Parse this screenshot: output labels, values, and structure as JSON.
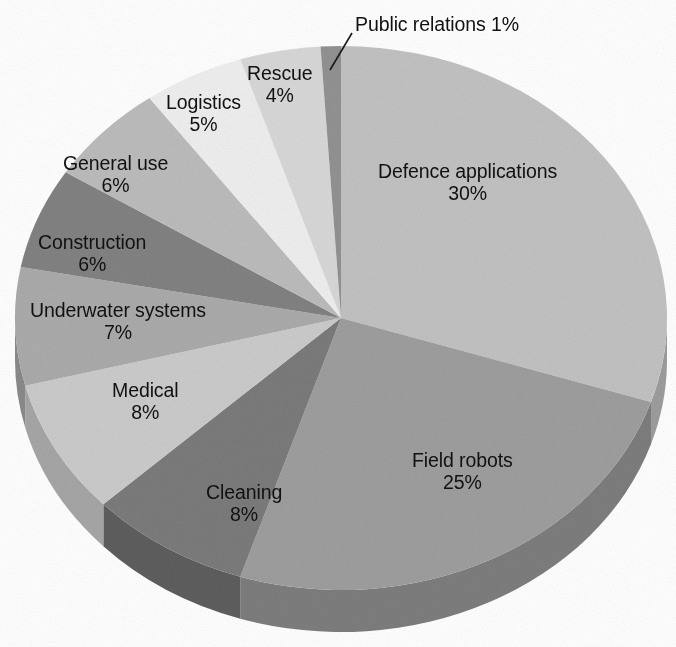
{
  "chart_data": {
    "type": "pie",
    "title": "",
    "subtitle": "",
    "xlabel": "",
    "ylabel": "",
    "legend_position": "none",
    "grid": false,
    "style": "3d-exploded-none",
    "value_unit": "%",
    "categories": [
      "Defence applications",
      "Field robots",
      "Cleaning",
      "Medical",
      "Underwater systems",
      "Construction",
      "General use",
      "Logistics",
      "Rescue",
      "Public relations"
    ],
    "values": [
      30,
      25,
      8,
      8,
      7,
      6,
      6,
      5,
      4,
      1
    ],
    "labels": [
      "Defence applications 30%",
      "Field robots 25%",
      "Cleaning 8%",
      "Medical 8%",
      "Underwater systems 7%",
      "Construction 6%",
      "General use 6%",
      "Logistics 5%",
      "Rescue 4%",
      "Public relations 1%"
    ],
    "slices": [
      {
        "name": "Defence applications",
        "value": 30,
        "value_text": "30%",
        "color": "#c2c2c2",
        "side_color": "#9d9d9d",
        "label_layout": "stacked",
        "label_x": 378,
        "label_y": 160,
        "has_leader": false
      },
      {
        "name": "Field robots",
        "value": 25,
        "value_text": "25%",
        "color": "#9e9e9e",
        "side_color": "#7d7d7d",
        "label_layout": "stacked",
        "label_x": 412,
        "label_y": 449,
        "has_leader": false
      },
      {
        "name": "Cleaning",
        "value": 8,
        "value_text": "8%",
        "color": "#7b7b7b",
        "side_color": "#5e5e5e",
        "label_layout": "stacked",
        "label_x": 206,
        "label_y": 481,
        "has_leader": false
      },
      {
        "name": "Medical",
        "value": 8,
        "value_text": "8%",
        "color": "#cbcbcb",
        "side_color": "#a6a6a6",
        "label_layout": "stacked",
        "label_x": 112,
        "label_y": 379,
        "has_leader": false
      },
      {
        "name": "Underwater systems",
        "value": 7,
        "value_text": "7%",
        "color": "#ababab",
        "side_color": "#8a8a8a",
        "label_layout": "stacked",
        "label_x": 30,
        "label_y": 299,
        "has_leader": false
      },
      {
        "name": "Construction",
        "value": 6,
        "value_text": "6%",
        "color": "#828282",
        "side_color": "#656565",
        "label_layout": "stacked",
        "label_x": 38,
        "label_y": 231,
        "has_leader": false
      },
      {
        "name": "General use",
        "value": 6,
        "value_text": "6%",
        "color": "#bcbcbc",
        "side_color": "#979797",
        "label_layout": "stacked",
        "label_x": 63,
        "label_y": 152,
        "has_leader": false
      },
      {
        "name": "Logistics",
        "value": 5,
        "value_text": "5%",
        "color": "#efefef",
        "side_color": "#c4c4c4",
        "label_layout": "stacked",
        "label_x": 166,
        "label_y": 91,
        "has_leader": false
      },
      {
        "name": "Rescue",
        "value": 4,
        "value_text": "4%",
        "color": "#d8d8d8",
        "side_color": "#b0b0b0",
        "label_layout": "stacked",
        "label_x": 247,
        "label_y": 62,
        "has_leader": false
      },
      {
        "name": "Public relations",
        "value": 1,
        "value_text": "1%",
        "color": "#929292",
        "side_color": "#747474",
        "label_layout": "inline",
        "label_x": 355,
        "label_y": 13,
        "has_leader": true,
        "leader": {
          "x1": 352,
          "y1": 33,
          "x2": 330,
          "y2": 70
        }
      }
    ],
    "geometry": {
      "center_x": 341,
      "center_y": 318,
      "radius_x": 326,
      "radius_y": 272,
      "depth": 42,
      "start_angle_deg": -90,
      "direction": "clockwise"
    },
    "colors": {
      "background": "#ffffff",
      "text": "#111111",
      "leader_line": "#1a1a1a"
    }
  }
}
